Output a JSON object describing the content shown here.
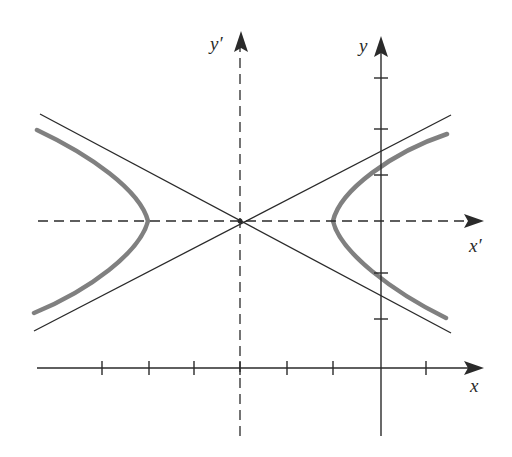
{
  "diagram": {
    "labels": {
      "x_axis": "x",
      "y_axis": "y",
      "x_prime_axis": "x′",
      "y_prime_axis": "y′"
    },
    "colors": {
      "axis": "#2a2a2a",
      "asymptote": "#2a2a2a",
      "hyperbola": "#808080",
      "background": "#ffffff"
    },
    "geometry": {
      "center": [
        240,
        221
      ],
      "vertex_left": [
        148,
        221
      ],
      "vertex_right": [
        333,
        221
      ],
      "x_axis_y": 368,
      "y_axis_x": 381,
      "x_ticks": [
        102,
        149,
        194,
        240,
        287,
        333,
        426
      ],
      "y_ticks": [
        78,
        129,
        175,
        273,
        319
      ]
    },
    "elements": [
      "x-axis (solid, with tick marks and arrow)",
      "y-axis (solid, with tick marks and arrow)",
      "x'-axis (dashed, with arrow)",
      "y'-axis (dashed, with arrow)",
      "two asymptote lines crossing at center",
      "left and right branches of hyperbola (thick gray)"
    ]
  }
}
